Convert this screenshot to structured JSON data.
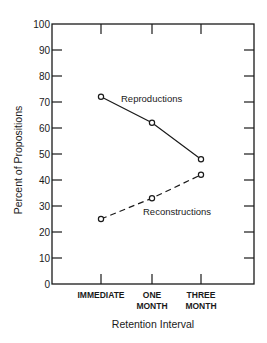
{
  "chart_data": {
    "type": "line",
    "title": "",
    "xlabel": "Retention Interval",
    "ylabel": "Percent of Propositions",
    "categories": [
      "IMMEDIATE",
      "ONE MONTH",
      "THREE MONTH"
    ],
    "category_lines": [
      [
        "IMMEDIATE"
      ],
      [
        "ONE",
        "MONTH"
      ],
      [
        "THREE",
        "MONTH"
      ]
    ],
    "series": [
      {
        "name": "Reproductions",
        "values": [
          72,
          62,
          48
        ],
        "line_style": "solid",
        "marker": "open-circle"
      },
      {
        "name": "Reconstructions",
        "values": [
          25,
          33,
          42
        ],
        "line_style": "dashed",
        "marker": "open-circle"
      }
    ],
    "ylim": [
      0,
      100
    ],
    "yticks": [
      0,
      10,
      20,
      30,
      40,
      50,
      60,
      70,
      80,
      90,
      100
    ],
    "grid": false,
    "legend": "inline labels near lines",
    "colors": {
      "line": "#1a1a1a",
      "background": "#ffffff"
    }
  }
}
